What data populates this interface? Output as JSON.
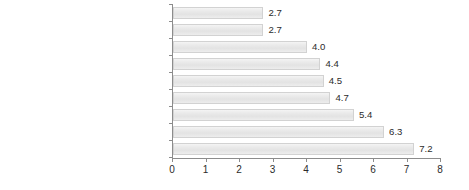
{
  "chart_data": {
    "type": "bar",
    "orientation": "horizontal",
    "title": "",
    "xlabel": "",
    "ylabel": "",
    "xlim": [
      0,
      8
    ],
    "xticks": [
      "0",
      "1",
      "2",
      "3",
      "4",
      "5",
      "6",
      "7",
      "8"
    ],
    "grid": false,
    "legend": false,
    "categories": [
      "Modern and contemporary image",
      "Innovation",
      "Continuous improvements",
      "Makes life easier",
      "Latest trends and developments",
      "Best phone network",
      "Top quality",
      "Operator you can trust",
      "Helps people communicate"
    ],
    "values": [
      2.7,
      2.7,
      4.0,
      4.4,
      4.5,
      4.7,
      5.4,
      6.3,
      7.2
    ],
    "value_labels": [
      "2.7",
      "2.7",
      "4.0",
      "4.4",
      "4.5",
      "4.7",
      "5.4",
      "6.3",
      "7.2"
    ],
    "colors": {
      "bar_fill_top": "#f4f4f4",
      "bar_fill_mid": "#e3e3e3",
      "bar_border": "#d2d2d2",
      "axis": "#8c8c8c",
      "text": "#2b2b2b",
      "background": "#ffffff"
    }
  }
}
